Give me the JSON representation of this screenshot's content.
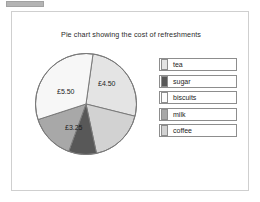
{
  "panel": {
    "title": "Pie chart showing the cost of refreshments"
  },
  "colors": {
    "tea": "#e4e4e4",
    "sugar": "#585858",
    "biscuits": "#fbfbfb",
    "milk": "#a8a8a8",
    "coffee": "#d2d2d2",
    "outline": "#7a7a7a",
    "panel_border": "#cfcfcf",
    "text": "#1d1d1d"
  },
  "chart_data": {
    "type": "pie",
    "title": "Pie chart showing the cost of refreshments",
    "legend_position": "right",
    "categories": [
      "tea",
      "sugar",
      "biscuits",
      "milk",
      "coffee"
    ],
    "slices": [
      {
        "name": "tea",
        "label": "£4.50",
        "value": 4.5,
        "start_angle": 8,
        "end_angle": 104,
        "fill": "#e4e4e4",
        "label_x": 66,
        "label_y": 36,
        "label_shown": true
      },
      {
        "name": "coffee",
        "label": "",
        "value": 3.0,
        "start_angle": 104,
        "end_angle": 168,
        "fill": "#d2d2d2",
        "label_x": 0,
        "label_y": 0,
        "label_shown": false
      },
      {
        "name": "sugar",
        "label": "",
        "value": 1.5,
        "start_angle": 168,
        "end_angle": 200,
        "fill": "#585858",
        "label_x": 0,
        "label_y": 0,
        "label_shown": false
      },
      {
        "name": "milk",
        "label": "£3.25",
        "value": 3.25,
        "start_angle": 200,
        "end_angle": 252,
        "fill": "#a8a8a8",
        "label_x": 33,
        "label_y": 80,
        "label_shown": true
      },
      {
        "name": "biscuits",
        "label": "£5.50",
        "value": 5.5,
        "start_angle": 252,
        "end_angle": 368,
        "fill": "#f7f7f7",
        "label_x": 25,
        "label_y": 44,
        "label_shown": true
      }
    ],
    "labels_visible": [
      "£4.50",
      "£5.50",
      "£3.25"
    ]
  },
  "legend": {
    "items": [
      {
        "label": "tea",
        "swatch": "#e4e4e4"
      },
      {
        "label": "sugar",
        "swatch": "#585858"
      },
      {
        "label": "biscuits",
        "swatch": "#fbfbfb"
      },
      {
        "label": "milk",
        "swatch": "#a8a8a8"
      },
      {
        "label": "coffee",
        "swatch": "#d2d2d2"
      }
    ]
  }
}
